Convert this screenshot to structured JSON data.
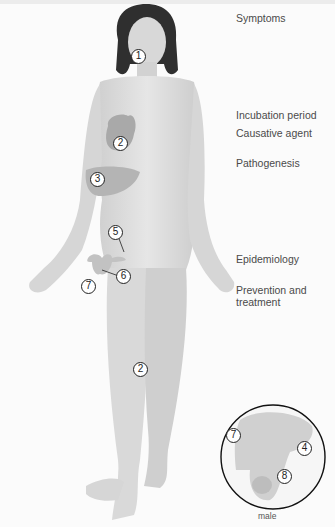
{
  "diagram": {
    "topics": [
      {
        "id": "symptoms",
        "label": "Symptoms"
      },
      {
        "id": "incubation",
        "label": "Incubation period"
      },
      {
        "id": "causative",
        "label": "Causative agent"
      },
      {
        "id": "pathogenesis",
        "label": "Pathogenesis"
      },
      {
        "id": "epidemiology",
        "label": "Epidemiology"
      },
      {
        "id": "prevention",
        "label": "Prevention and treatment"
      }
    ],
    "markers": {
      "head": "1",
      "heart": "2",
      "liver": "3",
      "uterus_tube": "5",
      "ovary": "6",
      "vagina": "7",
      "leg": "2",
      "inset_penis": "7",
      "inset_prostate": "4",
      "inset_testis": "8"
    },
    "inset_caption": "male",
    "colors": {
      "skin": "#dcdcdc",
      "hair": "#2f2f2f",
      "organ": "#b0b0b0",
      "text": "#4a4a4a"
    }
  }
}
